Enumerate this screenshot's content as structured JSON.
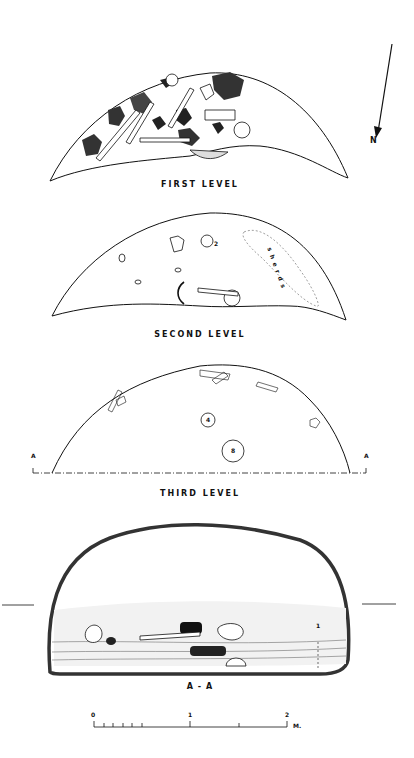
{
  "figure": {
    "north_arrow": {
      "label": "N"
    },
    "levels": [
      {
        "id": "first",
        "title": "FIRST LEVEL"
      },
      {
        "id": "second",
        "title": "SECOND LEVEL",
        "annotation": "sherds",
        "find_numbers": [
          "1",
          "2"
        ]
      },
      {
        "id": "third",
        "title": "THIRD LEVEL",
        "find_numbers": [
          "4",
          "8"
        ],
        "section_markers": [
          "A",
          "A"
        ]
      }
    ],
    "section": {
      "title": "A - A",
      "layer_numbers": [
        "1",
        "2",
        "3",
        "4",
        "5"
      ]
    },
    "scale_bar": {
      "ticks": [
        "0",
        "1",
        "2"
      ],
      "unit": "M."
    }
  }
}
